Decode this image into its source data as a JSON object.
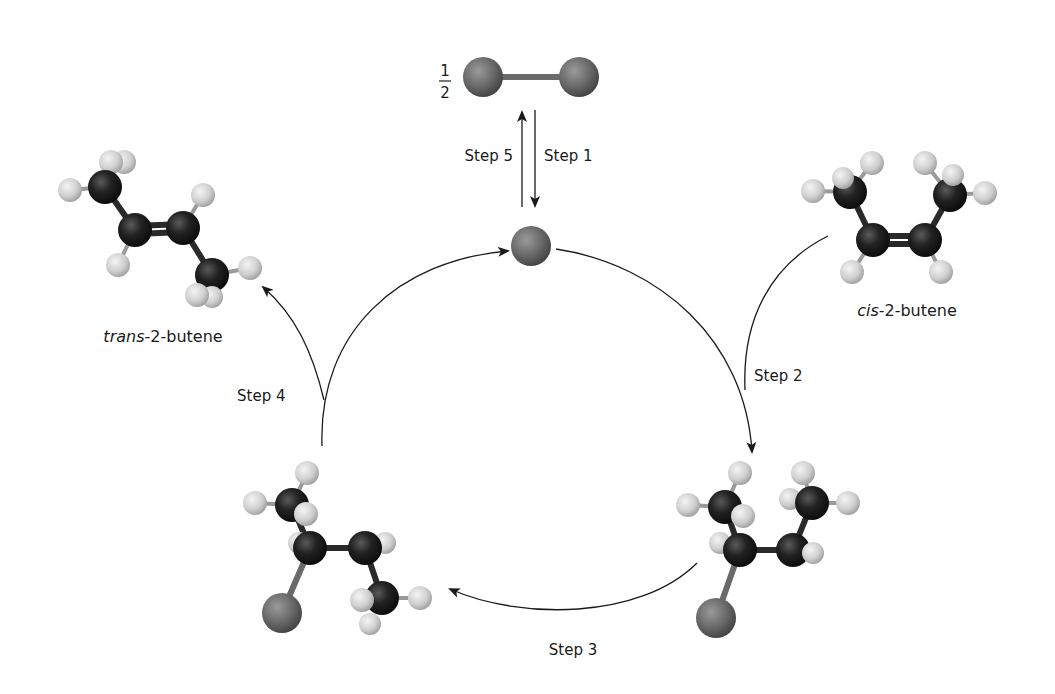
{
  "diagram": {
    "fraction": {
      "numerator": "1",
      "denominator": "2"
    },
    "steps": {
      "step1": "Step 1",
      "step2": "Step 2",
      "step3": "Step 3",
      "step4": "Step 4",
      "step5": "Step 5"
    },
    "molecules": {
      "trans": {
        "prefix": "trans",
        "suffix": "-2-butene"
      },
      "cis": {
        "prefix": "cis",
        "suffix": "-2-butene"
      }
    },
    "colors": {
      "carbon": "#1e1e1e",
      "hydrogen": "#d8d8d8",
      "catalyst_atom": "#6e6e6e",
      "arrow": "#1a1a1a",
      "background": "#ffffff"
    }
  }
}
